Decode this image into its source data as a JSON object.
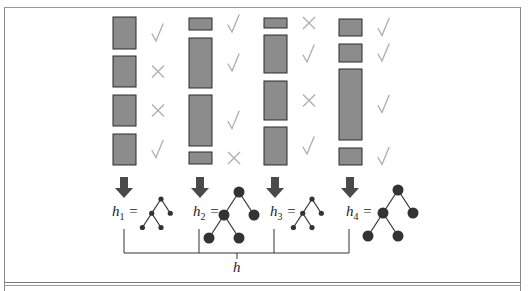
{
  "figure": {
    "colors": {
      "box_fill": "#8c8c8c",
      "box_stroke": "#2a2a2a",
      "mark_color": "#b0b0b0",
      "arrow_color": "#4a4a4a",
      "tree_color": "#333333",
      "line_color": "#333333"
    },
    "columns": [
      {
        "label_base": "h",
        "label_sub": "1",
        "label_suffix": " =",
        "tree_size": "small",
        "boxes": [
          {
            "top": 17,
            "height": 32,
            "mark": "check"
          },
          {
            "top": 56,
            "height": 31,
            "mark": "cross"
          },
          {
            "top": 95,
            "height": 31,
            "mark": "cross"
          },
          {
            "top": 134,
            "height": 31,
            "mark": "check"
          }
        ]
      },
      {
        "label_base": "h",
        "label_sub": "2",
        "label_suffix": " =",
        "tree_size": "large",
        "boxes": [
          {
            "top": 18,
            "height": 12,
            "mark": "check"
          },
          {
            "top": 38,
            "height": 50,
            "mark": "check"
          },
          {
            "top": 95,
            "height": 51,
            "mark": "check"
          },
          {
            "top": 152,
            "height": 12,
            "mark": "cross"
          }
        ]
      },
      {
        "label_base": "h",
        "label_sub": "3",
        "label_suffix": " =",
        "tree_size": "small",
        "boxes": [
          {
            "top": 18,
            "height": 10,
            "mark": "cross"
          },
          {
            "top": 35,
            "height": 38,
            "mark": "check"
          },
          {
            "top": 81,
            "height": 39,
            "mark": "cross"
          },
          {
            "top": 127,
            "height": 38,
            "mark": "check"
          }
        ]
      },
      {
        "label_base": "h",
        "label_sub": "4",
        "label_suffix": " =",
        "tree_size": "large",
        "boxes": [
          {
            "top": 19,
            "height": 17,
            "mark": "check"
          },
          {
            "top": 44,
            "height": 18,
            "mark": "check"
          },
          {
            "top": 69,
            "height": 71,
            "mark": "check"
          },
          {
            "top": 148,
            "height": 17,
            "mark": "check"
          }
        ]
      }
    ],
    "combined_label": "h",
    "icons": {
      "check": "check-mark-icon",
      "cross": "cross-mark-icon",
      "arrow": "down-arrow-icon",
      "tree": "decision-tree-icon"
    }
  }
}
